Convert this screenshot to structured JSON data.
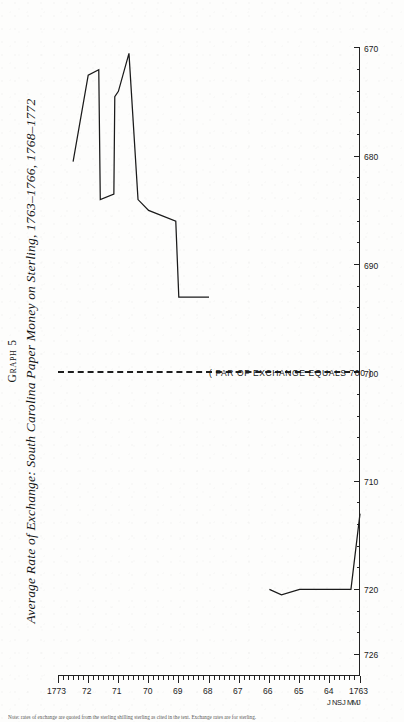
{
  "page": {
    "graph_number": "Graph 5",
    "title": "Average Rate of Exchange: South Carolina Paper Money on Sterling, 1763–1766, 1768–1772",
    "footnote": "Note: rates of exchange are quoted from the sterling shilling sterling as cited in the text. Exchange rates are for sterling."
  },
  "annotations": {
    "par_label": "( PAR OF EXCHANGE EQUALS 700 )",
    "par_value": 700
  },
  "chart_data": {
    "type": "line",
    "title": "Average Rate of Exchange: South Carolina Paper Money on Sterling, 1763–1766, 1768–1772",
    "orientation": "time-axis-vertical",
    "xlabel": "",
    "ylabel": "",
    "grid": false,
    "legend": "none",
    "value_axis": {
      "name": "Rate of exchange (South Carolina currency per £100 sterling)",
      "labels": [
        "726",
        "720",
        "710",
        "700",
        "690",
        "680",
        "670"
      ],
      "ticks": [
        726,
        720,
        710,
        700,
        690,
        680,
        670
      ],
      "minor_step": 2,
      "range": [
        670,
        728
      ],
      "direction": "descending-left-to-right"
    },
    "time_axis": {
      "name": "Year",
      "labels": [
        "1763",
        "64",
        "65",
        "66",
        "67",
        "68",
        "69",
        "70",
        "71",
        "72",
        "1773"
      ],
      "ticks": [
        1763,
        1764,
        1765,
        1766,
        1767,
        1768,
        1769,
        1770,
        1771,
        1772,
        1773
      ],
      "month_labels": [
        "J",
        "M",
        "M",
        "J",
        "S",
        "N",
        "J"
      ],
      "minor_step_months": 2,
      "range": [
        1763.0,
        1773.0
      ]
    },
    "reference_lines": [
      {
        "value": 700,
        "style": "dashed",
        "label": "( PAR OF EXCHANGE EQUALS 700 )"
      }
    ],
    "series": [
      {
        "name": "1763–1766",
        "points": [
          {
            "t": 1763.0,
            "v": 713.0
          },
          {
            "t": 1763.3,
            "v": 720.0
          },
          {
            "t": 1764.0,
            "v": 720.0
          },
          {
            "t": 1765.0,
            "v": 720.0
          },
          {
            "t": 1765.6,
            "v": 720.5
          },
          {
            "t": 1766.0,
            "v": 720.0
          }
        ]
      },
      {
        "name": "1768–1772",
        "points": [
          {
            "t": 1768.0,
            "v": 693.0
          },
          {
            "t": 1769.0,
            "v": 693.0
          },
          {
            "t": 1769.1,
            "v": 686.0
          },
          {
            "t": 1770.0,
            "v": 685.0
          },
          {
            "t": 1770.35,
            "v": 684.0
          },
          {
            "t": 1770.65,
            "v": 670.5
          },
          {
            "t": 1771.0,
            "v": 674.0
          },
          {
            "t": 1771.12,
            "v": 674.5
          },
          {
            "t": 1771.15,
            "v": 683.5
          },
          {
            "t": 1771.6,
            "v": 684.0
          },
          {
            "t": 1771.65,
            "v": 672.0
          },
          {
            "t": 1772.0,
            "v": 672.5
          },
          {
            "t": 1772.5,
            "v": 680.5
          }
        ]
      }
    ]
  }
}
